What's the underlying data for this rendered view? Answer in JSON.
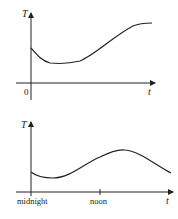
{
  "graphs": [
    {
      "y_axis_label": "T",
      "x_axis_label": "t",
      "origin_label": "0",
      "description": "Temperature T versus time t: drops from initial value to a minimum, stays low, then rises and levels off at a higher value"
    },
    {
      "y_axis_label": "T",
      "x_axis_label": "t",
      "tick_labels": [
        "midnight",
        "noon"
      ],
      "description": "Temperature T over a day: slight dip after midnight, rises to a peak in the afternoon, then declines"
    }
  ],
  "colors": {
    "ink": "#222222",
    "background": "#ffffff"
  }
}
